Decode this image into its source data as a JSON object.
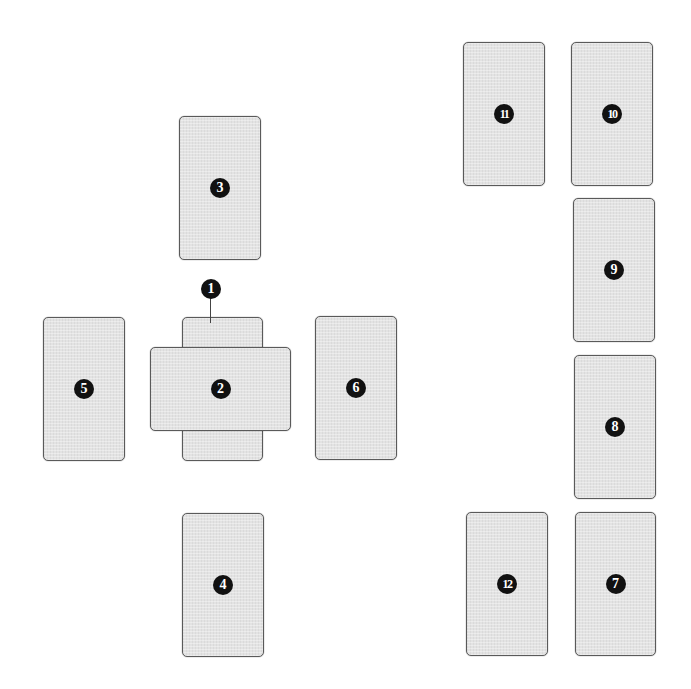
{
  "diagram": {
    "type": "card-spread-layout",
    "colors": {
      "card_fill": "#e3e3e3",
      "card_border": "#5a5a5a",
      "badge_fill": "#111111",
      "badge_text": "#ffffff",
      "background": "#ffffff"
    },
    "cards": [
      {
        "id": 1,
        "label": "1",
        "x": 182,
        "y": 317,
        "w": 81,
        "h": 144,
        "orientation": "vertical",
        "note": "under card 2, label via callout"
      },
      {
        "id": 2,
        "label": "2",
        "x": 150,
        "y": 347,
        "w": 141,
        "h": 84,
        "orientation": "horizontal",
        "note": "crossing card 1"
      },
      {
        "id": 3,
        "label": "3",
        "x": 179,
        "y": 116,
        "w": 82,
        "h": 144,
        "orientation": "vertical"
      },
      {
        "id": 4,
        "label": "4",
        "x": 182,
        "y": 513,
        "w": 82,
        "h": 144,
        "orientation": "vertical"
      },
      {
        "id": 5,
        "label": "5",
        "x": 43,
        "y": 317,
        "w": 82,
        "h": 144,
        "orientation": "vertical"
      },
      {
        "id": 6,
        "label": "6",
        "x": 315,
        "y": 316,
        "w": 82,
        "h": 144,
        "orientation": "vertical"
      },
      {
        "id": 7,
        "label": "7",
        "x": 575,
        "y": 512,
        "w": 81,
        "h": 144,
        "orientation": "vertical"
      },
      {
        "id": 8,
        "label": "8",
        "x": 574,
        "y": 355,
        "w": 82,
        "h": 144,
        "orientation": "vertical"
      },
      {
        "id": 9,
        "label": "9",
        "x": 573,
        "y": 198,
        "w": 82,
        "h": 144,
        "orientation": "vertical"
      },
      {
        "id": 10,
        "label": "10",
        "x": 571,
        "y": 42,
        "w": 82,
        "h": 144,
        "orientation": "vertical"
      },
      {
        "id": 11,
        "label": "11",
        "x": 463,
        "y": 42,
        "w": 82,
        "h": 144,
        "orientation": "vertical"
      },
      {
        "id": 12,
        "label": "12",
        "x": 466,
        "y": 512,
        "w": 82,
        "h": 144,
        "orientation": "vertical"
      }
    ],
    "callout": {
      "label": "1",
      "badge_x": 201,
      "badge_y": 279,
      "line_x": 210,
      "line_top": 298,
      "line_bottom": 323
    }
  }
}
